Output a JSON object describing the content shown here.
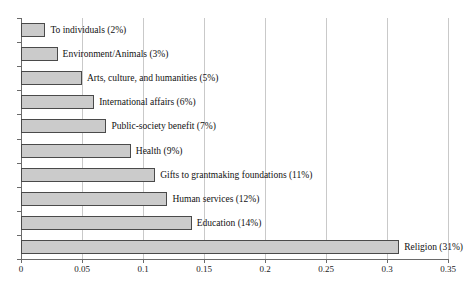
{
  "chart_data": {
    "type": "bar",
    "orientation": "horizontal",
    "title": "",
    "xlabel": "",
    "ylabel": "",
    "xlim": [
      0,
      0.35
    ],
    "grid": true,
    "legend": "none",
    "xticks": [
      "0",
      "0.05",
      "0.1",
      "0.15",
      "0.2",
      "0.25",
      "0.3",
      "0.35"
    ],
    "xtick_values": [
      0,
      0.05,
      0.1,
      0.15,
      0.2,
      0.25,
      0.3,
      0.35
    ],
    "categories": [
      "To individuals",
      "Environment/Animals",
      "Arts, culture, and humanities",
      "International affairs",
      "Public-society benefit",
      "Health",
      "Gifts to grantmaking foundations",
      "Human services",
      "Education",
      "Religion"
    ],
    "values": [
      0.02,
      0.03,
      0.05,
      0.06,
      0.07,
      0.09,
      0.11,
      0.12,
      0.14,
      0.31
    ],
    "data_labels": [
      "To individuals (2%)",
      "Environment/Animals (3%)",
      "Arts, culture, and humanities (5%)",
      "International affairs (6%)",
      "Public-society benefit (7%)",
      "Health (9%)",
      "Gifts to grantmaking foundations (11%)",
      "Human services (12%)",
      "Education (14%)",
      "Religion (31%)"
    ],
    "colors": {
      "bar_fill": "#cbcbcb",
      "bar_border": "#4a4a4a",
      "gridline": "#c9c9c9",
      "axis": "#6a6a6a",
      "text": "#111111",
      "background": "#ffffff"
    }
  }
}
